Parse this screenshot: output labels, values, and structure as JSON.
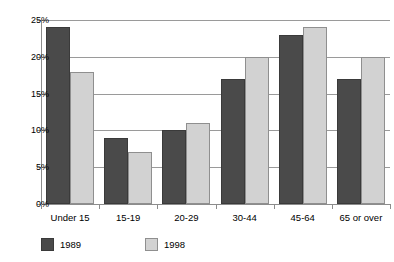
{
  "chart_data": {
    "type": "bar",
    "title": "",
    "xlabel": "",
    "ylabel": "",
    "categories": [
      "Under 15",
      "15-19",
      "20-29",
      "30-44",
      "45-64",
      "65 or over"
    ],
    "series": [
      {
        "name": "1989",
        "color": "#4a4a4a",
        "values": [
          24,
          9,
          10,
          17,
          23,
          17
        ]
      },
      {
        "name": "1998",
        "color": "#d2d2d2",
        "values": [
          18,
          7,
          11,
          20,
          24,
          20
        ]
      }
    ],
    "ylim": [
      0,
      25
    ],
    "ytick_values": [
      0,
      5,
      10,
      15,
      20,
      25
    ],
    "ytick_labels": [
      "0%",
      "5%",
      "10%",
      "15%",
      "20%",
      "25%"
    ],
    "grid": true,
    "grid_axis": "y",
    "legend_position": "bottom-left",
    "value_suffix": "%"
  },
  "legend": {
    "entries": [
      {
        "label": "1989"
      },
      {
        "label": "1998"
      }
    ]
  },
  "axes": {
    "y_axis_name": "percentage-axis",
    "x_axis_name": "age-group-axis"
  }
}
